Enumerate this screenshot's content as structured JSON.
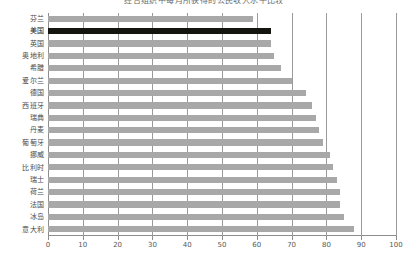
{
  "chart_data": {
    "type": "bar",
    "orientation": "horizontal",
    "title": "经合组织中每月所获得的公民收入水平比较",
    "xlabel": "",
    "ylabel": "",
    "xlim": [
      0,
      100
    ],
    "xticks": [
      0,
      10,
      20,
      30,
      40,
      50,
      60,
      70,
      80,
      90,
      100
    ],
    "grid": true,
    "legend": "none",
    "categories": [
      "芬兰",
      "美国",
      "英国",
      "奥地利",
      "希腊",
      "爱尔兰",
      "德国",
      "西班牙",
      "瑞典",
      "丹麦",
      "葡萄牙",
      "挪威",
      "比利时",
      "瑞士",
      "荷兰",
      "法国",
      "冰岛",
      "意大利"
    ],
    "values": [
      59,
      64,
      64,
      65,
      67,
      70,
      74,
      76,
      77,
      78,
      79,
      81,
      82,
      83,
      84,
      84,
      85,
      88
    ],
    "highlight_category": "美国",
    "colors": {
      "bar": "#a8a8a8",
      "highlight": "#15150f",
      "axis": "#8d8d8d",
      "grid": "#9a9a9a",
      "text": "#4a4a4a"
    }
  }
}
